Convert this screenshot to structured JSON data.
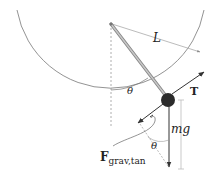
{
  "diagram": {
    "labels": {
      "length": "L",
      "angle_pivot": "θ",
      "tension": "T",
      "weight": "mg",
      "angle_force": "θ",
      "tangential_force_main": "F",
      "tangential_force_sub": "grav,tan"
    },
    "geometry": {
      "pivot": [
        111,
        24
      ],
      "bob": [
        168,
        100
      ],
      "bob_radius": 7,
      "arc_radius": 95
    },
    "colors": {
      "line": "#555555",
      "rod": "#9a9a9a",
      "bob": "#2b2b2b",
      "dashed": "#999999",
      "arrow": "#333333"
    }
  }
}
